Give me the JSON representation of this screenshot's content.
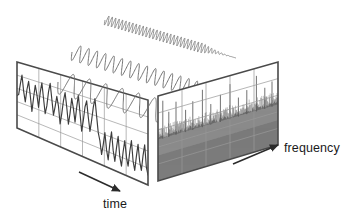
{
  "figure": {
    "background_color": "#ffffff"
  },
  "labels": {
    "time": "time",
    "frequency": "frequency"
  },
  "colors": {
    "panel_border": "#4a4a4a",
    "grid_line": "#9a9a9a",
    "waveform": "#3c3c3c",
    "sinusoid": "#6e6e6e",
    "spectrum_fill": "#8c8c8c",
    "spectrum_fill_dark": "#707070",
    "spike": "#585858",
    "arrow": "#2b2b2b",
    "text": "#1a1a1a"
  },
  "time_panel": {
    "name": "time-domain-panel",
    "corners": {
      "top_left": [
        17,
        62
      ],
      "top_right": [
        148,
        100
      ],
      "bottom_right": [
        148,
        185
      ],
      "bottom_left": [
        17,
        128
      ]
    },
    "grid_columns": 6,
    "grid_rows": 5
  },
  "frequency_panel": {
    "name": "frequency-domain-panel",
    "corners": {
      "top_left": [
        158,
        96
      ],
      "top_right": [
        278,
        62
      ],
      "bottom_right": [
        278,
        145
      ],
      "bottom_left": [
        158,
        181
      ]
    },
    "grid_columns": 5,
    "grid_rows": 5,
    "noise_floor_fraction": 0.52
  },
  "chart_data": {
    "type": "line",
    "xlabel": "time",
    "ylabel": "",
    "panels": [
      {
        "name": "time-domain",
        "type": "line",
        "xlabel": "time",
        "grid": true,
        "series": [
          {
            "name": "composite-signal",
            "values": [
              0.04,
              0.1,
              0.52,
              0.88,
              0.3,
              -0.08,
              0.4,
              0.72,
              0.22,
              -0.34,
              0.18,
              0.66,
              0.34,
              -0.1,
              0.46,
              0.82,
              0.28,
              -0.24,
              0.06,
              0.58,
              0.9,
              0.36,
              -0.18,
              0.14,
              0.52,
              0.2,
              -0.4,
              -0.02,
              0.44,
              0.74,
              0.26,
              -0.3,
              0.1,
              0.62,
              0.3,
              -0.14,
              0.38,
              0.8,
              0.22,
              -0.36,
              0.02,
              0.48,
              0.7,
              0.18,
              -0.26,
              0.12,
              0.56,
              0.86,
              0.32,
              -0.2,
              -0.44,
              -0.86,
              -0.52,
              -0.12,
              -0.64,
              -0.94,
              -0.4,
              -0.02,
              -0.58,
              -0.9,
              -0.46,
              -0.08,
              -0.7,
              -0.96,
              -0.5,
              -0.14,
              -0.62,
              -0.88,
              -0.42,
              -0.06,
              -0.66,
              -0.92,
              -0.48,
              -0.1,
              -0.6,
              -0.84,
              -0.38,
              -0.04,
              -0.68,
              -0.9
            ]
          }
        ]
      },
      {
        "name": "sinusoid-components",
        "type": "line",
        "series": [
          {
            "name": "low-frequency-component",
            "cycles": 9,
            "amplitude": 1.0
          },
          {
            "name": "mid-frequency-component",
            "cycles": 18,
            "amplitude": 0.82
          },
          {
            "name": "high-frequency-component",
            "cycles": 38,
            "amplitude": 0.62
          }
        ]
      },
      {
        "name": "frequency-domain",
        "type": "bar",
        "xlabel": "frequency",
        "grid": true,
        "noise_floor": 0.5,
        "peaks": [
          {
            "position": 0.04,
            "height": 0.95
          },
          {
            "position": 0.09,
            "height": 0.6
          },
          {
            "position": 0.15,
            "height": 0.82
          },
          {
            "position": 0.23,
            "height": 0.52
          },
          {
            "position": 0.29,
            "height": 0.7
          },
          {
            "position": 0.37,
            "height": 0.94
          },
          {
            "position": 0.44,
            "height": 0.48
          },
          {
            "position": 0.52,
            "height": 0.66
          },
          {
            "position": 0.6,
            "height": 0.88
          },
          {
            "position": 0.67,
            "height": 0.44
          },
          {
            "position": 0.74,
            "height": 0.58
          },
          {
            "position": 0.82,
            "height": 0.9
          },
          {
            "position": 0.89,
            "height": 0.5
          },
          {
            "position": 0.95,
            "height": 0.62
          }
        ]
      }
    ]
  }
}
